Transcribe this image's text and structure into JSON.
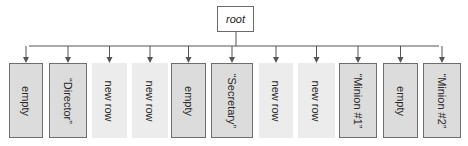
{
  "root": {
    "label": "root"
  },
  "children": [
    {
      "label": "empty",
      "style": "filled",
      "x": 9,
      "w": 34
    },
    {
      "label": "“Director”",
      "style": "filled",
      "x": 49,
      "w": 38
    },
    {
      "label": "new row",
      "style": "ghost",
      "x": 92,
      "w": 35
    },
    {
      "label": "new row",
      "style": "ghost",
      "x": 132,
      "w": 36
    },
    {
      "label": "empty",
      "style": "filled",
      "x": 171,
      "w": 35
    },
    {
      "label": "“Secretary”",
      "style": "filled",
      "x": 211,
      "w": 42
    },
    {
      "label": "new row",
      "style": "ghost",
      "x": 259,
      "w": 34
    },
    {
      "label": "new row",
      "style": "ghost",
      "x": 298,
      "w": 37
    },
    {
      "label": "“Minion #1”",
      "style": "filled",
      "x": 339,
      "w": 38
    },
    {
      "label": "empty",
      "style": "filled",
      "x": 383,
      "w": 35
    },
    {
      "label": "“Minion #2”",
      "style": "filled",
      "x": 423,
      "w": 38
    }
  ],
  "colors": {
    "line": "#555555",
    "filled_box": "#dcdcdc",
    "ghost_box": "#ececec",
    "border": "#6e6e6e"
  }
}
